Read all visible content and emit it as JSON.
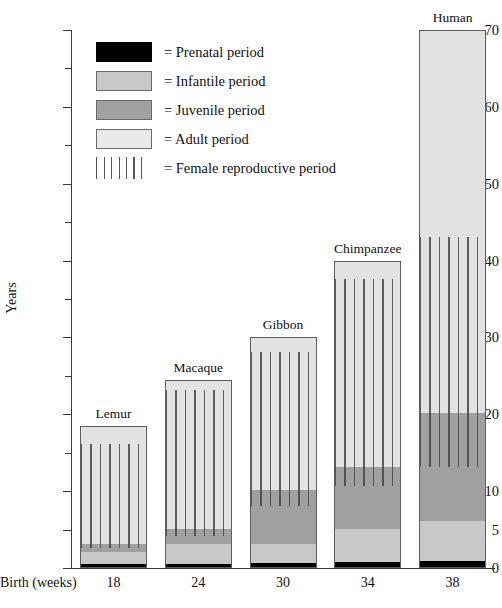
{
  "chart_data": {
    "type": "bar",
    "title": "",
    "subtitle": "",
    "stacked": true,
    "ylabel": "Years",
    "xlabel": "Birth (weeks)",
    "ylim": [
      0,
      70
    ],
    "grid": false,
    "y_major_ticks": [
      0,
      5,
      10,
      20,
      30,
      40,
      50,
      60,
      70
    ],
    "y_minor_ticks": [
      15,
      25,
      35,
      45,
      55,
      65
    ],
    "legend_position": "upper-left-inside",
    "categories": [
      "Lemur",
      "Macaque",
      "Gibbon",
      "Chimpanzee",
      "Human"
    ],
    "x_tick_labels": [
      "18",
      "24",
      "30",
      "34",
      "38"
    ],
    "series": [
      {
        "name": "Prenatal period",
        "color": "#000000",
        "values": [
          0.35,
          0.45,
          0.55,
          0.65,
          0.73
        ]
      },
      {
        "name": "Infantile period",
        "color": "#c8c8c8",
        "values": [
          1.65,
          2.55,
          2.45,
          4.35,
          5.27
        ]
      },
      {
        "name": "Juvenile period",
        "color": "#a0a0a0",
        "values": [
          1.0,
          2.0,
          7.0,
          8.0,
          14.0
        ]
      },
      {
        "name": "Adult period",
        "color": "#e2e2e2",
        "values": [
          15.5,
          19.5,
          20.0,
          27.0,
          50.0
        ]
      }
    ],
    "totals": [
      18.5,
      24.5,
      30.0,
      40.0,
      70.0
    ],
    "overlay": {
      "name": "Female reproductive period",
      "color": "#464646",
      "spans": [
        {
          "category": "Lemur",
          "start": 2.5,
          "end": 16.0
        },
        {
          "category": "Macaque",
          "start": 4.0,
          "end": 23.0
        },
        {
          "category": "Gibbon",
          "start": 8.0,
          "end": 28.0
        },
        {
          "category": "Chimpanzee",
          "start": 10.5,
          "end": 37.5
        },
        {
          "category": "Human",
          "start": 13.0,
          "end": 43.0
        }
      ]
    }
  },
  "legend": {
    "items": [
      {
        "swatch": "prenatal",
        "label": "=  Prenatal period"
      },
      {
        "swatch": "infantile",
        "label": "=  Infantile period"
      },
      {
        "swatch": "juvenile",
        "label": "=  Juvenile period"
      },
      {
        "swatch": "adult",
        "label": "=  Adult period"
      },
      {
        "swatch": "repro",
        "label": "=  Female reproductive period"
      }
    ]
  },
  "axis": {
    "y_title": "Years",
    "x_title": "Birth (weeks)",
    "y_labels": [
      "70",
      "60",
      "50",
      "40",
      "30",
      "20",
      "10",
      "5",
      "0"
    ]
  }
}
